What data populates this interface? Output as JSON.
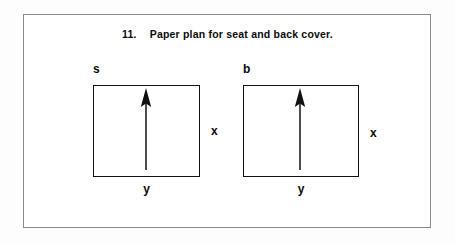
{
  "figure": {
    "caption_number": "11.",
    "caption_text": "Paper plan for seat and back cover.",
    "frame_color": "#8a8a8a",
    "ink_color": "#111111",
    "background_color": "#ffffff"
  },
  "panels": [
    {
      "key": "seat",
      "top_label": "s",
      "side_label": "x",
      "bottom_label": "y",
      "arrow_direction": "up",
      "arrow_name": "grain-direction-arrow"
    },
    {
      "key": "back",
      "top_label": "b",
      "side_label": "x",
      "bottom_label": "y",
      "arrow_direction": "up",
      "arrow_name": "grain-direction-arrow"
    }
  ]
}
